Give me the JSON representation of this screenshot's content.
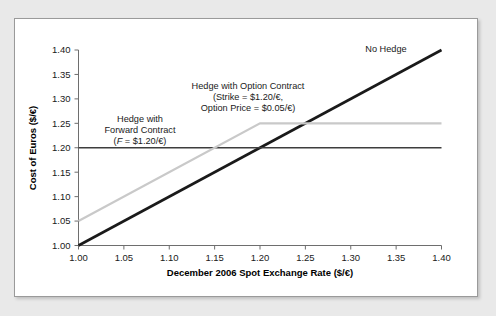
{
  "chart_data": {
    "type": "line",
    "title": "",
    "xlabel": "December 2006 Spot Exchange Rate ($/€)",
    "ylabel": "Cost of Euros ($/€)",
    "xlim": [
      1.0,
      1.4
    ],
    "ylim": [
      1.0,
      1.4
    ],
    "grid": false,
    "legend_position": "inline-annotations",
    "xticks": [
      "1.00",
      "1.05",
      "1.10",
      "1.15",
      "1.20",
      "1.25",
      "1.30",
      "1.35",
      "1.40"
    ],
    "xtick_values": [
      1.0,
      1.05,
      1.1,
      1.15,
      1.2,
      1.25,
      1.3,
      1.35,
      1.4
    ],
    "yticks": [
      "1.00",
      "1.05",
      "1.10",
      "1.15",
      "1.20",
      "1.25",
      "1.30",
      "1.35",
      "1.40"
    ],
    "ytick_values": [
      1.0,
      1.05,
      1.1,
      1.15,
      1.2,
      1.25,
      1.3,
      1.35,
      1.4
    ],
    "series": [
      {
        "name": "No Hedge",
        "color": "#1a1a1a",
        "width": 2.6,
        "x": [
          1.0,
          1.4
        ],
        "values": [
          1.0,
          1.4
        ]
      },
      {
        "name": "Hedge with Forward Contract",
        "color": "#3d3d3d",
        "width": 1.3,
        "x": [
          1.0,
          1.4
        ],
        "values": [
          1.2,
          1.2
        ]
      },
      {
        "name": "Hedge with Option Contract",
        "color": "#c9c9c9",
        "width": 2.2,
        "x": [
          1.0,
          1.2,
          1.4
        ],
        "values": [
          1.05,
          1.25,
          1.25
        ]
      }
    ],
    "annotations": [
      {
        "id": "no-hedge",
        "lines": [
          "No Hedge"
        ],
        "x": 1.315,
        "y": 1.393
      },
      {
        "id": "forward-contract",
        "lines": [
          "Hedge with",
          "Forward Contract",
          "(F = $1.20/€)"
        ],
        "x": 1.085,
        "y": 1.275
      },
      {
        "id": "option-contract",
        "lines": [
          "Hedge with Option Contract",
          "(Strike = $1.20/€,",
          "Option Price = $0.05/€)"
        ],
        "x": 1.185,
        "y": 1.325
      }
    ]
  },
  "annotation_text": {
    "no_hedge_line1": "No Hedge",
    "forward_line1": "Hedge with",
    "forward_line2": "Forward Contract",
    "forward_line3_prefix": "(",
    "forward_line3_var": "F",
    "forward_line3_suffix": " = $1.20/€)",
    "option_line1": "Hedge with Option Contract",
    "option_line2": "(Strike = $1.20/€,",
    "option_line3": "Option Price = $0.05/€)"
  },
  "axes": {
    "x_title": "December 2006 Spot Exchange Rate ($/€)",
    "y_title": "Cost of Euros ($/€)",
    "x_tick_labels": [
      "1.00",
      "1.05",
      "1.10",
      "1.15",
      "1.20",
      "1.25",
      "1.30",
      "1.35",
      "1.40"
    ],
    "y_tick_labels": [
      "1.00",
      "1.05",
      "1.10",
      "1.15",
      "1.20",
      "1.25",
      "1.30",
      "1.35",
      "1.40"
    ]
  },
  "colors": {
    "page_background": "#e9e9e9",
    "card_background": "#ffffff",
    "card_border": "#9a9a9a",
    "axis": "#6e6e6e",
    "no_hedge": "#1a1a1a",
    "forward": "#3d3d3d",
    "option": "#c9c9c9",
    "text": "#1a1a1a"
  }
}
